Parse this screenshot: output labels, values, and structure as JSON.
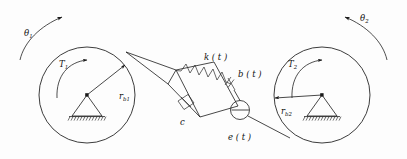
{
  "figure": {
    "background_color": "#fdfdfd",
    "line_color": "#1a1a1a"
  },
  "left_disk": {
    "name": "disk-1",
    "rotation_label": "θ",
    "rotation_subscript": "1",
    "torque_label": "T",
    "torque_subscript": "1",
    "radius_label": "r",
    "radius_subscript": "b1",
    "center_x": 87,
    "center_y": 95,
    "radius": 48,
    "pivot_label": "ground-pivot-1"
  },
  "right_disk": {
    "name": "disk-2",
    "rotation_label": "θ",
    "rotation_subscript": "2",
    "torque_label": "T",
    "torque_subscript": "2",
    "radius_label": "r",
    "radius_subscript": "b2",
    "center_x": 322,
    "center_y": 95,
    "radius": 48,
    "pivot_label": "ground-pivot-2"
  },
  "mesh_element": {
    "spring_label": "k ( t )",
    "damper_label": "b ( t )",
    "viscous_label": "c",
    "excitation_label": "e ( t )"
  },
  "icons": {
    "spring": "zigzag-spring-icon",
    "dashpot": "dashpot-damper-icon",
    "ground": "hatched-ground-icon",
    "pivot": "triangle-pivot-icon",
    "excitation": "circle-excitation-icon",
    "arrow": "arrowhead-icon"
  }
}
